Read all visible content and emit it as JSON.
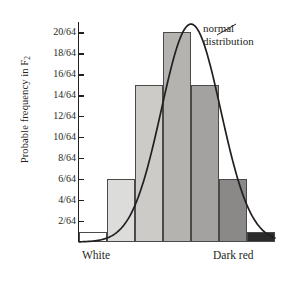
{
  "chart_data": {
    "type": "bar",
    "title": "",
    "xlabel": "",
    "ylabel": "Probable frequency in F",
    "ylabel_sub": "2",
    "ylim": [
      0,
      21
    ],
    "grid": false,
    "legend_position": "none",
    "y_tick_labels": [
      "2/64",
      "4/64",
      "6/64",
      "8/64",
      "10/64",
      "12/64",
      "14/64",
      "16/64",
      "18/64",
      "20/64"
    ],
    "y_tick_values": [
      2,
      4,
      6,
      8,
      10,
      12,
      14,
      16,
      18,
      20
    ],
    "x_tick_labels": [
      "White",
      "Dark red"
    ],
    "categories": [
      "1",
      "2",
      "3",
      "4",
      "5",
      "6",
      "7"
    ],
    "values": [
      1,
      6,
      15,
      20,
      15,
      6,
      1
    ],
    "value_labels": [
      "1/64",
      "6/64",
      "15/64",
      "20/64",
      "15/64",
      "6/64",
      "1/64"
    ],
    "bar_colors": [
      "#ffffff",
      "#dcdcda",
      "#cccbc8",
      "#b4b3b0",
      "#a3a2a0",
      "#8a8987",
      "#2b2b2b"
    ],
    "annotations": [
      {
        "line1": "normal",
        "line2": "distribution"
      }
    ],
    "overlay_curve": {
      "name": "normal distribution",
      "color": "#231f20",
      "mean": 4.0,
      "peak_value": 20.8
    }
  }
}
